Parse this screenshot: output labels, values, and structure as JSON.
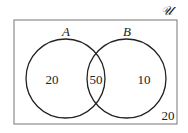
{
  "diagram": {
    "type": "venn",
    "universe_label": "𝒰",
    "sets": [
      {
        "label": "A"
      },
      {
        "label": "B"
      }
    ],
    "regions": {
      "only_A": "20",
      "A_and_B": "50",
      "only_B": "10",
      "outside": "20"
    },
    "colors": {
      "stroke": "#222222",
      "border": "#777777",
      "background": "#ffffff"
    }
  }
}
